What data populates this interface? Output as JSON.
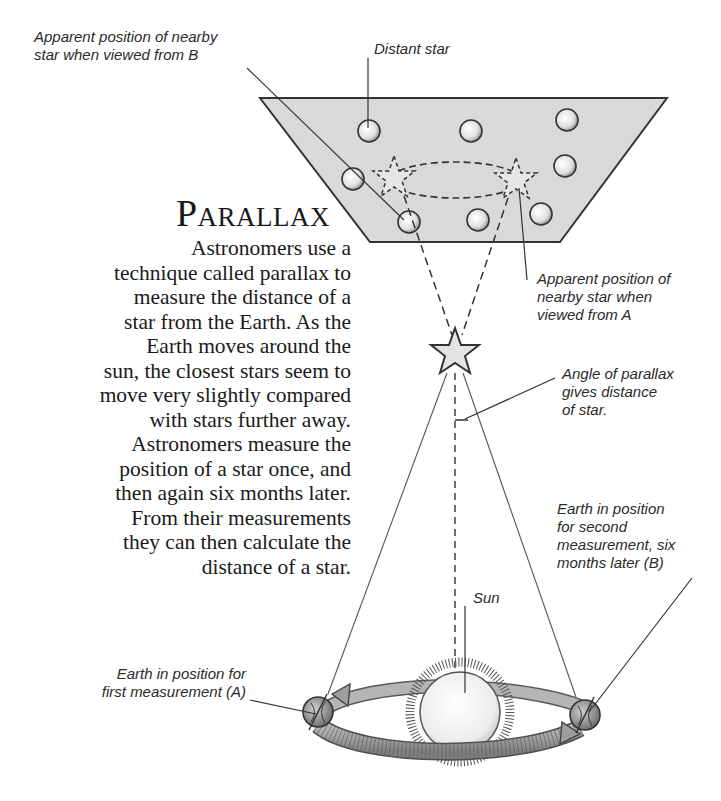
{
  "title": "Parallax",
  "body_lines": [
    "Astronomers use a",
    "technique called parallax to",
    "measure the distance of a",
    "star from the Earth. As the",
    "Earth moves around the",
    "sun, the closest stars seem to",
    "move very slightly compared",
    "with stars further away.",
    "Astronomers measure the",
    "position of a star once, and",
    "then again six months later.",
    "From their measurements",
    "they can then calculate the",
    "distance of a star."
  ],
  "labels": {
    "apparent_b": "Apparent position of nearby\nstar when viewed from B",
    "distant_star": "Distant star",
    "apparent_a": "Apparent position of\nnearby star when\nviewed from A",
    "angle": "Angle of parallax\ngives distance\nof star.",
    "earth_b": "Earth in position\nfor second\nmeasurement, six\nmonths later (B)",
    "sun": "Sun",
    "earth_a": "Earth in position for\nfirst measurement (A)"
  },
  "colors": {
    "sky_panel": "#d9d9d9",
    "ink": "#2a2a2a",
    "orbit": "#9a9a9a",
    "sun": "#f2f2f2",
    "background": "#ffffff"
  }
}
